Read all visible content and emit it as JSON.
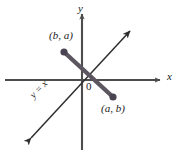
{
  "figure": {
    "background": "#ffffff",
    "width": 178,
    "height": 154,
    "colors": {
      "axis": "#4d4d4d",
      "reflection_line": "#3a3a3a",
      "segment": "#5c5660",
      "point": "#4a4452",
      "text": "#1a1a1a"
    }
  },
  "axes": {
    "x_label": "x",
    "y_label": "y",
    "origin_label": "0",
    "x_axis": {
      "x1": 5,
      "y1": 80,
      "x2": 160,
      "y2": 80
    },
    "y_axis": {
      "x1": 82,
      "y1": 150,
      "x2": 82,
      "y2": 14
    }
  },
  "reflection_line": {
    "label": "y = x",
    "from": {
      "x": 31,
      "y": 138
    },
    "to": {
      "x": 130,
      "y": 31
    },
    "arrows": "both"
  },
  "segment": {
    "from": {
      "x": 64,
      "y": 52
    },
    "to": {
      "x": 113,
      "y": 97
    }
  },
  "points": [
    {
      "label": "(b, a)",
      "x": 64,
      "y": 52,
      "label_x": 49,
      "label_y": 30
    },
    {
      "label": "(a, b)",
      "x": 113,
      "y": 97,
      "label_x": 101,
      "label_y": 103
    }
  ]
}
